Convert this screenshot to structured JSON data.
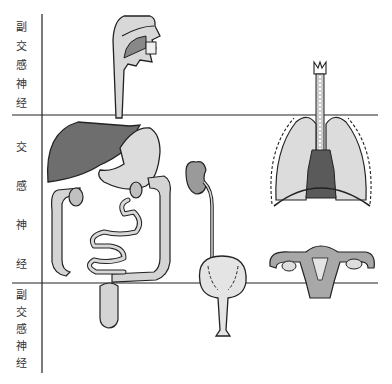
{
  "diagram": {
    "title": "",
    "regions": [
      {
        "id": "top",
        "label_chars": [
          "副",
          "交",
          "感",
          "神",
          "经"
        ],
        "label": "副交感神经"
      },
      {
        "id": "middle",
        "label_chars": [
          "交",
          "感",
          "神",
          "经"
        ],
        "label": "交感神经"
      },
      {
        "id": "bottom",
        "label_chars": [
          "副",
          "交",
          "感",
          "神",
          "经"
        ],
        "label": "副交感神经"
      }
    ],
    "organs": [
      {
        "name": "mouth-esophagus",
        "region": "top-to-middle"
      },
      {
        "name": "liver",
        "region": "middle"
      },
      {
        "name": "stomach",
        "region": "middle"
      },
      {
        "name": "small-intestine",
        "region": "middle"
      },
      {
        "name": "large-intestine",
        "region": "middle"
      },
      {
        "name": "rectum",
        "region": "bottom"
      },
      {
        "name": "kidney-ureter",
        "region": "middle"
      },
      {
        "name": "bladder",
        "region": "middle-to-bottom"
      },
      {
        "name": "trachea",
        "region": "top"
      },
      {
        "name": "lungs",
        "region": "middle"
      },
      {
        "name": "uterus-ovaries",
        "region": "middle-to-bottom"
      }
    ],
    "colors": {
      "liver": "#6e6e6e",
      "organ_fill": "#d6d6d6",
      "outline": "#222222",
      "divider": "#222222",
      "text": "#333333"
    }
  }
}
